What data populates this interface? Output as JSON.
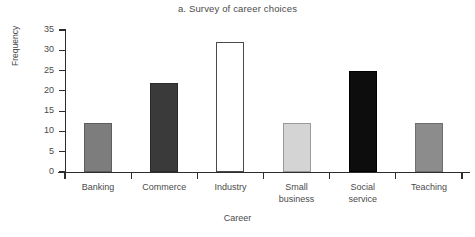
{
  "chart_data": {
    "type": "bar",
    "title": "a. Survey of career choices",
    "xlabel": "Career",
    "ylabel": "Frequency",
    "categories": [
      "Banking",
      "Commerce",
      "Industry",
      "Small business",
      "Social service",
      "Teaching"
    ],
    "category_lines": [
      [
        "Banking"
      ],
      [
        "Commerce"
      ],
      [
        "Industry"
      ],
      [
        "Small",
        "business"
      ],
      [
        "Social",
        "service"
      ],
      [
        "Teaching"
      ]
    ],
    "values": [
      12,
      22,
      32,
      12,
      25,
      12
    ],
    "ylim": [
      0,
      35
    ],
    "yticks": [
      0,
      5,
      10,
      15,
      20,
      25,
      30,
      35
    ],
    "ytick_labels": [
      "0",
      "5",
      "10",
      "15",
      "20",
      "25",
      "30",
      "35"
    ],
    "grid": false,
    "legend": null,
    "bar_colors": [
      "#7d7d7d",
      "#3a3a3a",
      "#ffffff",
      "#d4d4d4",
      "#0d0d0d",
      "#8c8c8c"
    ],
    "bar_edge_colors": [
      "#5d5d5d",
      "#2a2a2a",
      "#4a4a4a",
      "#9a9a9a",
      "#000000",
      "#6e6e6e"
    ]
  },
  "axis": {
    "tick_color": "#2d2d2d",
    "text_color": "#4a4a4a"
  }
}
